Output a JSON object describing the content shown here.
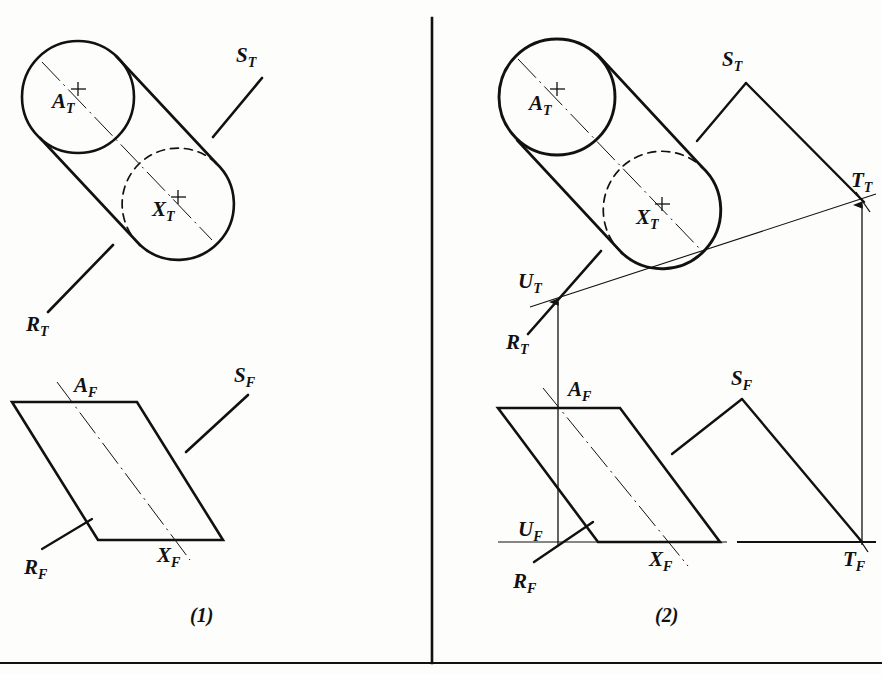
{
  "page": {
    "width": 882,
    "height": 675,
    "background_color": "#fdfdfb",
    "ink_color": "#111111"
  },
  "borders": {
    "vertical_divider": {
      "x": 432,
      "y1": 18,
      "y2": 663
    },
    "bottom_rule": {
      "x1": 0,
      "y1": 663,
      "x2": 882,
      "y2": 663
    }
  },
  "captions": [
    {
      "id": "caption-1",
      "text": "(1)",
      "x": 190,
      "y": 622
    },
    {
      "id": "caption-2",
      "text": "(2)",
      "x": 655,
      "y": 622
    }
  ],
  "panel1": {
    "name": "stage-one",
    "top_view": {
      "circle_a": {
        "label": "A",
        "sub": "T",
        "cx": 78,
        "cy": 97,
        "r": 56,
        "style": "solid"
      },
      "circle_x": {
        "label": "X",
        "sub": "T",
        "cx": 178,
        "cy": 203,
        "r": 53,
        "style": "half-dashed"
      },
      "labels": [
        {
          "id": "label-at",
          "text": "A",
          "sub": "T",
          "x": 52,
          "y": 108
        },
        {
          "id": "label-xt",
          "text": "X",
          "sub": "T",
          "x": 152,
          "y": 216
        }
      ],
      "leaders": [
        {
          "id": "leader-st",
          "label": "S",
          "sub": "T",
          "from_x": 213,
          "from_y": 137,
          "to_x": 262,
          "to_y": 78,
          "label_x": 236,
          "label_y": 62
        },
        {
          "id": "leader-rt",
          "label": "R",
          "sub": "T",
          "from_x": 113,
          "from_y": 245,
          "to_x": 48,
          "to_y": 312,
          "label_x": 26,
          "label_y": 331
        }
      ]
    },
    "front_view": {
      "parallelogram": [
        {
          "x": 12,
          "y": 402
        },
        {
          "x": 137,
          "y": 402
        },
        {
          "x": 223,
          "y": 540
        },
        {
          "x": 98,
          "y": 540
        }
      ],
      "axis_line": {
        "x1": 57,
        "y1": 382,
        "x2": 190,
        "y2": 560
      },
      "labels": [
        {
          "id": "label-af",
          "text": "A",
          "sub": "F",
          "x": 74,
          "y": 392
        },
        {
          "id": "label-xf",
          "text": "X",
          "sub": "F",
          "x": 157,
          "y": 562
        }
      ],
      "leaders": [
        {
          "id": "leader-sf",
          "label": "S",
          "sub": "F",
          "from_x": 186,
          "from_y": 452,
          "to_x": 248,
          "to_y": 395,
          "label_x": 234,
          "label_y": 382
        },
        {
          "id": "leader-rf",
          "label": "R",
          "sub": "F",
          "from_x": 92,
          "from_y": 519,
          "to_x": 42,
          "to_y": 549,
          "label_x": 24,
          "label_y": 574
        }
      ]
    }
  },
  "panel2": {
    "name": "stage-two",
    "top_view": {
      "circle_a": {
        "label": "A",
        "sub": "T",
        "cx": 557,
        "cy": 97,
        "r": 58,
        "style": "solid"
      },
      "circle_x": {
        "label": "X",
        "sub": "T",
        "cx": 662,
        "cy": 210,
        "r": 55,
        "style": "half-dashed"
      },
      "labels": [
        {
          "id": "label-at2",
          "text": "A",
          "sub": "T",
          "x": 529,
          "y": 110
        },
        {
          "id": "label-xt2",
          "text": "X",
          "sub": "T",
          "x": 636,
          "y": 224
        }
      ],
      "trace_line": {
        "id": "trace-t",
        "from_x": 530,
        "from_y": 307,
        "to_x": 876,
        "to_y": 194
      },
      "points": [
        {
          "id": "point-ut",
          "label": "U",
          "sub": "T",
          "x": 558,
          "y": 297,
          "label_x": 524,
          "label_y": 288
        },
        {
          "id": "point-tt",
          "label": "T",
          "sub": "T",
          "x": 862,
          "y": 200,
          "label_x": 855,
          "label_y": 187
        }
      ],
      "leaders": [
        {
          "id": "leader-st2",
          "label": "S",
          "sub": "T",
          "from_x": 697,
          "from_y": 141,
          "to_x": 746,
          "to_y": 83,
          "label_x": 722,
          "label_y": 66
        },
        {
          "id": "leader-rt2",
          "label": "R",
          "sub": "T",
          "from_x": 601,
          "from_y": 251,
          "to_x": 528,
          "to_y": 334,
          "label_x": 506,
          "label_y": 349
        }
      ],
      "ray_st_to_tt": {
        "from_x": 746,
        "from_y": 83,
        "to_x": 862,
        "to_y": 200
      }
    },
    "front_view": {
      "parallelogram": [
        {
          "x": 498,
          "y": 408
        },
        {
          "x": 620,
          "y": 408
        },
        {
          "x": 720,
          "y": 542
        },
        {
          "x": 598,
          "y": 542
        }
      ],
      "axis_line": {
        "x1": 543,
        "y1": 388,
        "x2": 688,
        "y2": 566
      },
      "ground_line": {
        "x1": 498,
        "y1": 542,
        "x2": 875,
        "y2": 542
      },
      "labels": [
        {
          "id": "label-af2",
          "text": "A",
          "sub": "F",
          "x": 568,
          "y": 396
        },
        {
          "id": "label-xf2",
          "text": "X",
          "sub": "F",
          "x": 655,
          "y": 566
        },
        {
          "id": "label-uf",
          "text": "U",
          "sub": "F",
          "x": 521,
          "y": 536
        },
        {
          "id": "label-tf",
          "text": "T",
          "sub": "F",
          "x": 848,
          "y": 564
        }
      ],
      "leaders": [
        {
          "id": "leader-sf2",
          "label": "S",
          "sub": "F",
          "from_x": 672,
          "from_y": 454,
          "to_x": 742,
          "to_y": 399,
          "label_x": 731,
          "label_y": 385
        },
        {
          "id": "leader-rf2",
          "label": "R",
          "sub": "F",
          "from_x": 593,
          "from_y": 522,
          "to_x": 534,
          "to_y": 562,
          "label_x": 513,
          "label_y": 588
        }
      ],
      "ray_sf_to_tf": {
        "from_x": 742,
        "from_y": 399,
        "to_x": 862,
        "to_y": 542
      },
      "projectors": [
        {
          "id": "projector-u",
          "x": 558,
          "y_top": 542,
          "y_bottom": 297,
          "arrow": "up"
        },
        {
          "id": "projector-t",
          "x": 862,
          "y_top": 542,
          "y_bottom": 200,
          "arrow": "up"
        }
      ]
    }
  }
}
